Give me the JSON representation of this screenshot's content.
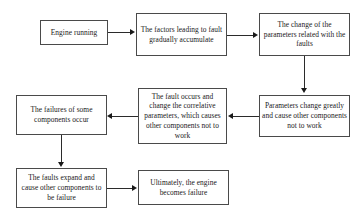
{
  "diagram": {
    "background_color": "#ffffff",
    "box_border_color": "#4a4a4a",
    "connector_color": "#2b2b2b",
    "text_color": "#1a1a1a",
    "nodes": [
      {
        "id": "engine-running",
        "label": "Engine running",
        "x": 40,
        "y": 20,
        "w": 68,
        "h": 25
      },
      {
        "id": "factors-leading-to-fault",
        "label": "The factors leading to fault gradually accumulate",
        "x": 136,
        "y": 13,
        "w": 91,
        "h": 43
      },
      {
        "id": "change-of-parameters",
        "label": "The change of the parameters related with the faults",
        "x": 259,
        "y": 13,
        "w": 91,
        "h": 43
      },
      {
        "id": "parameters-change-greatly",
        "label": "Parameters change greatly and cause other components not to work",
        "x": 259,
        "y": 95,
        "w": 91,
        "h": 42
      },
      {
        "id": "fault-occurs-correlative",
        "label": "The fault occurs and change the correlative parameters, which causes other components not to work",
        "x": 138,
        "y": 88,
        "w": 89,
        "h": 56
      },
      {
        "id": "failures-of-components",
        "label": "The failures of some components occur",
        "x": 16,
        "y": 95,
        "w": 91,
        "h": 40
      },
      {
        "id": "faults-expand",
        "label": "The faults expand and cause other components to be failure",
        "x": 16,
        "y": 168,
        "w": 91,
        "h": 40
      },
      {
        "id": "engine-becomes-failure",
        "label": "Ultimately, the engine becomes failure",
        "x": 138,
        "y": 170,
        "w": 91,
        "h": 35
      }
    ],
    "connectors": [
      {
        "id": "engine-running-to-factors",
        "from": "engine-running",
        "to": "factors-leading-to-fault",
        "direction": "right"
      },
      {
        "id": "factors-to-change-of-parameters",
        "from": "factors-leading-to-fault",
        "to": "change-of-parameters",
        "direction": "right"
      },
      {
        "id": "change-of-parameters-to-parameters-change",
        "from": "change-of-parameters",
        "to": "parameters-change-greatly",
        "direction": "down"
      },
      {
        "id": "parameters-change-to-fault-occurs",
        "from": "parameters-change-greatly",
        "to": "fault-occurs-correlative",
        "direction": "left"
      },
      {
        "id": "fault-occurs-to-failures",
        "from": "fault-occurs-correlative",
        "to": "failures-of-components",
        "direction": "left"
      },
      {
        "id": "failures-to-faults-expand",
        "from": "failures-of-components",
        "to": "faults-expand",
        "direction": "down"
      },
      {
        "id": "faults-expand-to-engine-failure",
        "from": "faults-expand",
        "to": "engine-becomes-failure",
        "direction": "right"
      }
    ]
  }
}
